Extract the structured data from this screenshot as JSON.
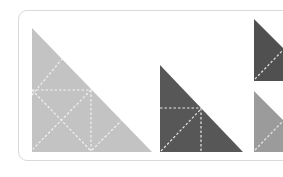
{
  "diagram": {
    "colors": {
      "light_grey": "#c3c3c3",
      "dark_grey": "#575757",
      "medium_grey": "#9b9b9b",
      "fold_line": "#f2f2f2",
      "card_border": "#d9d9d9"
    },
    "pieces": [
      {
        "name": "large-triangle",
        "color": "light_grey",
        "points": "32,28 32,152 152,152"
      },
      {
        "name": "medium-triangle",
        "color": "dark_grey",
        "points": "160,65 160,152 243,152"
      },
      {
        "name": "small-triangle-top",
        "color": "dark_grey",
        "points": "254,19 254,81 300,81 300,70"
      },
      {
        "name": "small-triangle-bottom",
        "color": "medium_grey",
        "points": "254,91 254,152 300,152 300,140"
      }
    ]
  }
}
